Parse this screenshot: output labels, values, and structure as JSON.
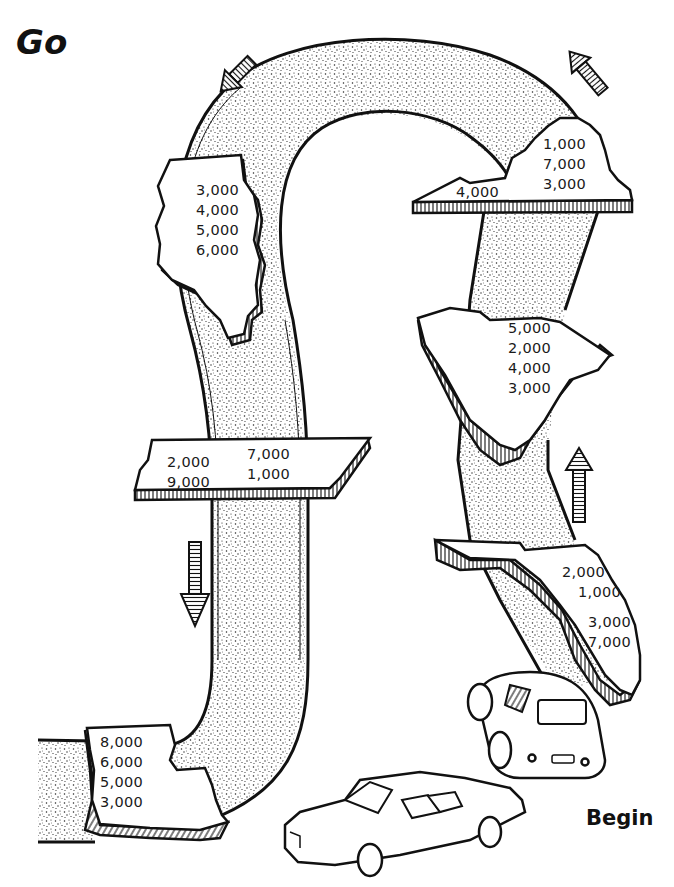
{
  "page": {
    "start_label": "Begin",
    "end_label": "Go"
  },
  "colors": {
    "ink": "#111111",
    "paper": "#ffffff",
    "road_stipple": "#333333"
  },
  "states": [
    {
      "id": "louisiana",
      "values": [
        "8,000",
        "6,000",
        "5,000",
        "3,000"
      ]
    },
    {
      "id": "tennessee",
      "left_values": [
        "2,000",
        "9,000"
      ],
      "right_values": [
        "7,000",
        "1,000"
      ]
    },
    {
      "id": "illinois",
      "values": [
        "3,000",
        "4,000",
        "5,000",
        "6,000"
      ]
    },
    {
      "id": "virginia",
      "values": [
        "1,000",
        "7,000",
        "3,000"
      ],
      "extra_value": "4,000"
    },
    {
      "id": "south-carolina",
      "values": [
        "5,000",
        "2,000",
        "4,000",
        "3,000"
      ]
    },
    {
      "id": "florida",
      "values": [
        "2,000",
        "1,000",
        "3,000",
        "7,000"
      ]
    }
  ],
  "arrows": [
    {
      "id": "arrow-down-left-top",
      "direction": "down-left"
    },
    {
      "id": "arrow-up-left-top",
      "direction": "up-left"
    },
    {
      "id": "arrow-down-middle",
      "direction": "down"
    },
    {
      "id": "arrow-up-right",
      "direction": "up"
    }
  ],
  "illustrations": [
    "sedan-car",
    "compact-car"
  ]
}
